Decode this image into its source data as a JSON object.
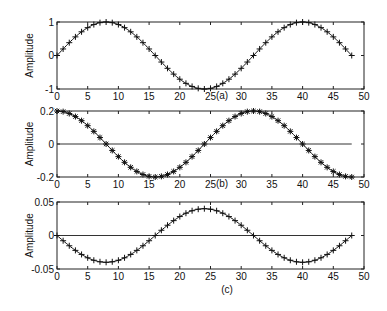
{
  "chart_data": [
    {
      "type": "line",
      "panel_label": "(a)",
      "ylabel": "Amplitude",
      "xlabel": "",
      "xlim": [
        0,
        50
      ],
      "ylim": [
        -1,
        1
      ],
      "xticks": [
        0,
        5,
        10,
        15,
        20,
        25,
        30,
        35,
        40,
        45,
        50
      ],
      "yticks": [
        -1,
        0,
        1
      ],
      "ytick_labels": [
        "-1",
        "0",
        "1"
      ],
      "zero_line": false,
      "marker": "+",
      "function": "1.0*sin(2*pi*t/32)",
      "amplitude": 1.0,
      "phase": "sin",
      "x_range": [
        0,
        48
      ],
      "series": [
        {
          "name": "signal a",
          "x_start": 0,
          "x_end": 48,
          "step": 1,
          "description": "sine, period 32, peaks at t=8 and t=40, trough at t=24"
        }
      ]
    },
    {
      "type": "line",
      "panel_label": "(b)",
      "ylabel": "Amplitude",
      "xlabel": "",
      "xlim": [
        0,
        50
      ],
      "ylim": [
        -0.2,
        0.2
      ],
      "xticks": [
        0,
        5,
        10,
        15,
        20,
        25,
        30,
        35,
        40,
        45,
        50
      ],
      "yticks": [
        -0.2,
        0,
        0.2
      ],
      "ytick_labels": [
        "-0.2",
        "0",
        "0.2"
      ],
      "zero_line": true,
      "marker": "*",
      "function": "0.2*cos(2*pi*t/32)",
      "amplitude": 0.2,
      "phase": "cos",
      "x_range": [
        0,
        48
      ],
      "series": [
        {
          "name": "signal b",
          "x_start": 0,
          "x_end": 48,
          "step": 1,
          "description": "cosine, period 32, max at t=0 and t=32, min at t=16 and t=48"
        }
      ]
    },
    {
      "type": "line",
      "panel_label": "(c)",
      "ylabel": "Amplitude",
      "xlabel": "",
      "xlim": [
        0,
        50
      ],
      "ylim": [
        -0.05,
        0.05
      ],
      "xticks": [
        0,
        5,
        10,
        15,
        20,
        25,
        30,
        35,
        40,
        45,
        50
      ],
      "yticks": [
        -0.05,
        0,
        0.05
      ],
      "ytick_labels": [
        "-0.05",
        "0",
        "0.05"
      ],
      "zero_line": true,
      "marker": "+",
      "function": "-0.04*sin(2*pi*t/32)",
      "amplitude": -0.04,
      "phase": "sin",
      "x_range": [
        0,
        48
      ],
      "series": [
        {
          "name": "signal c",
          "x_start": 0,
          "x_end": 48,
          "step": 1,
          "description": "negative sine, period 32, min -0.04 at t=8 and t=40, max 0.04 at t=24"
        }
      ]
    }
  ],
  "layout": {
    "axes_left": 57,
    "axes_right": 364,
    "panels": [
      {
        "top": 22,
        "bottom": 89,
        "label_x": 222,
        "label_y": 99
      },
      {
        "top": 111,
        "bottom": 177,
        "label_x": 222,
        "label_y": 187
      },
      {
        "top": 202,
        "bottom": 269,
        "label_x": 227,
        "label_y": 293
      }
    ]
  }
}
